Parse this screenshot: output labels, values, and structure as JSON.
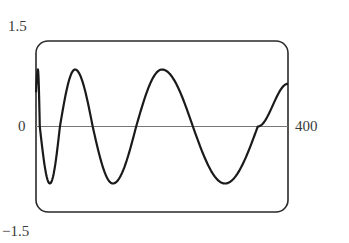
{
  "chart_data": {
    "type": "line",
    "title": "",
    "xlabel": "",
    "ylabel": "",
    "xlim": [
      0,
      400
    ],
    "ylim": [
      -1.5,
      1.5
    ],
    "grid": false,
    "legend": null,
    "tick_labels": {
      "y_top": "1.5",
      "y_zero": "0",
      "y_bottom": "−1.5",
      "x_right": "400"
    },
    "series": [
      {
        "name": "curve",
        "color": "#1a1a1a",
        "key_points": [
          {
            "x": 0,
            "y": 0.6
          },
          {
            "x": 3,
            "y": 1.0
          },
          {
            "x": 6,
            "y": 0.0
          },
          {
            "x": 22,
            "y": -1.0
          },
          {
            "x": 38,
            "y": 0.0
          },
          {
            "x": 62,
            "y": 1.0
          },
          {
            "x": 90,
            "y": 0.0
          },
          {
            "x": 122,
            "y": -1.0
          },
          {
            "x": 159,
            "y": 0.0
          },
          {
            "x": 200,
            "y": 1.0
          },
          {
            "x": 249,
            "y": 0.0
          },
          {
            "x": 300,
            "y": -1.0
          },
          {
            "x": 352,
            "y": 0.0
          },
          {
            "x": 400,
            "y": 0.75
          }
        ]
      }
    ]
  },
  "colors": {
    "frame": "#2a2a2a",
    "axis": "#777777",
    "curve": "#1a1a1a"
  }
}
